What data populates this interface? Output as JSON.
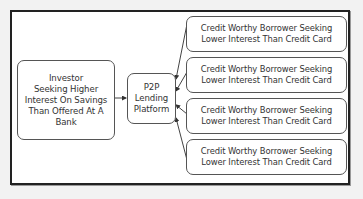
{
  "diagram": {
    "nodes": {
      "investor": {
        "lines": [
          "Investor",
          "Seeking Higher",
          "Interest On Savings",
          "Than Offered At A",
          "Bank"
        ]
      },
      "platform": {
        "lines": [
          "P2P",
          "Lending",
          "Platform"
        ]
      },
      "borrowers": [
        {
          "lines": [
            "Credit Worthy Borrower Seeking",
            "Lower Interest Than Credit Card"
          ]
        },
        {
          "lines": [
            "Credit Worthy Borrower Seeking",
            "Lower Interest Than Credit Card"
          ]
        },
        {
          "lines": [
            "Credit Worthy Borrower Seeking",
            "Lower Interest Than Credit Card"
          ]
        },
        {
          "lines": [
            "Credit Worthy Borrower Seeking",
            "Lower Interest Than Credit Card"
          ]
        }
      ]
    },
    "edges": [
      {
        "from": "investor",
        "to": "platform"
      },
      {
        "from": "borrowers.0",
        "to": "platform"
      },
      {
        "from": "borrowers.1",
        "to": "platform"
      },
      {
        "from": "borrowers.2",
        "to": "platform"
      },
      {
        "from": "borrowers.3",
        "to": "platform"
      }
    ],
    "colors": {
      "frame": "#222222",
      "box_border": "#555555",
      "text": "#333333",
      "background": "#ffffff"
    }
  }
}
